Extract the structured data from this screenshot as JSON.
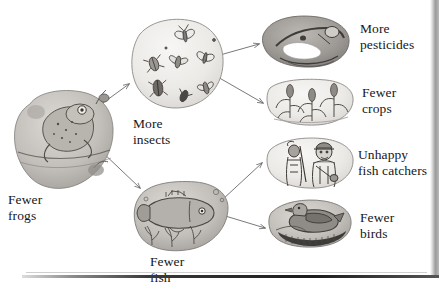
{
  "diagram": {
    "type": "flowchart",
    "background_color": "#ffffff",
    "text_color": "#17161a",
    "arrow_color": "#5a5a5a",
    "illustration_style": "pencil-and-wash blob vignettes"
  },
  "nodes": [
    {
      "id": "frogs",
      "label": "Fewer\nfrogs",
      "icon_name": "frog-blob-illustration",
      "x": 12,
      "y": 96,
      "w": 104,
      "h": 92,
      "label_x": 8,
      "label_y": 192
    },
    {
      "id": "insects",
      "label": "More\ninsects",
      "icon_name": "insects-blob-illustration",
      "x": 126,
      "y": 18,
      "w": 98,
      "h": 92,
      "label_x": 133,
      "label_y": 116
    },
    {
      "id": "fish",
      "label": "Fewer\nfish",
      "icon_name": "fish-blob-illustration",
      "x": 130,
      "y": 184,
      "w": 100,
      "h": 68,
      "label_x": 150,
      "label_y": 254
    },
    {
      "id": "pesticides",
      "label": "More\npesticides",
      "icon_name": "pesticide-sprayer-blob-illustration",
      "x": 258,
      "y": 16,
      "w": 94,
      "h": 50,
      "label_x": 360,
      "label_y": 21
    },
    {
      "id": "crops",
      "label": "Fewer\ncrops",
      "icon_name": "corn-crops-blob-illustration",
      "x": 262,
      "y": 80,
      "w": 92,
      "h": 46,
      "label_x": 362,
      "label_y": 85
    },
    {
      "id": "fishcatchers",
      "label": "Unhappy\nfish catchers",
      "icon_name": "fish-catchers-blob-illustration",
      "x": 262,
      "y": 140,
      "w": 92,
      "h": 48,
      "label_x": 358,
      "label_y": 147
    },
    {
      "id": "birds",
      "label": "Fewer\nbirds",
      "icon_name": "bird-blob-illustration",
      "x": 264,
      "y": 202,
      "w": 88,
      "h": 44,
      "label_x": 360,
      "label_y": 210
    }
  ],
  "arrows": [
    {
      "id": "frogs-to-insects",
      "from": "frogs",
      "to": "insects",
      "name": "arrow-frogs-to-insects"
    },
    {
      "id": "frogs-to-fish",
      "from": "frogs",
      "to": "fish",
      "name": "arrow-frogs-to-fish"
    },
    {
      "id": "insects-to-pesticides",
      "from": "insects",
      "to": "pesticides",
      "name": "arrow-insects-to-pesticides"
    },
    {
      "id": "insects-to-crops",
      "from": "insects",
      "to": "crops",
      "name": "arrow-insects-to-crops"
    },
    {
      "id": "fish-to-fishcatchers",
      "from": "fish",
      "to": "fishcatchers",
      "name": "arrow-fish-to-fishcatchers"
    },
    {
      "id": "fish-to-birds",
      "from": "fish",
      "to": "birds",
      "name": "arrow-fish-to-birds"
    }
  ]
}
